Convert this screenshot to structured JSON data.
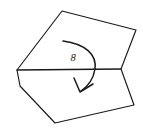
{
  "figure": {
    "background_color": "#ffffff",
    "stroke_color": "#1a1a1a",
    "width": 143,
    "height": 135,
    "angle_label": "8",
    "angle_label_position": {
      "x": 73,
      "y": 61
    },
    "shape": {
      "name": "irregular-heptagon",
      "description": "Closed irregular polygon outline",
      "points": "17,70 62,11 136,30 121,69 134,105 55,123 20,86"
    },
    "chord": {
      "name": "horizontal-chord",
      "description": "Straight horizontal segment across the polygon",
      "x1": 17,
      "y1": 70,
      "x2": 121,
      "y2": 69
    },
    "arrow": {
      "name": "clockwise-rotation-arrow",
      "description": "Curved arrow sweeping clockwise from upper left to lower left",
      "arc_path": "M 63,41 C 86,44 97,55 95,69 C 93,81 87,87 81,91",
      "head_path": "M 74,78 L 80,92 L 93,84"
    }
  }
}
